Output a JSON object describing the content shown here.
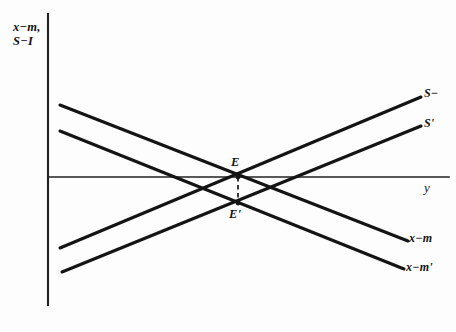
{
  "figure": {
    "name": "open-economy-balance-diagram",
    "background_color": "#fdfdfd",
    "ink_color": "#141414"
  },
  "axes": {
    "vertical": {
      "label_line1": "x−m,",
      "label_line2": "S−I",
      "x": 48,
      "y_top": 14,
      "y_bottom": 305
    },
    "horizontal": {
      "label": "y",
      "y": 177,
      "x_left": 48,
      "x_right": 449
    }
  },
  "curves": [
    {
      "name": "s-minus-i",
      "label": "S−",
      "direction": "upward",
      "x1": 60,
      "y1": 248,
      "x2": 421,
      "y2": 97
    },
    {
      "name": "s-minus-i-prime",
      "label": "S'",
      "direction": "upward",
      "x1": 62,
      "y1": 272,
      "x2": 421,
      "y2": 126
    },
    {
      "name": "x-minus-m",
      "label": "x−m",
      "direction": "downward",
      "x1": 60,
      "y1": 105,
      "x2": 408,
      "y2": 241
    },
    {
      "name": "x-minus-m-prime",
      "label": "x−m'",
      "direction": "downward",
      "x1": 60,
      "y1": 131,
      "x2": 404,
      "y2": 269
    }
  ],
  "points": [
    {
      "name": "equilibrium-e",
      "label": "E",
      "x": 238,
      "y": 177
    },
    {
      "name": "equilibrium-e-prime",
      "label": "E'",
      "x": 238,
      "y": 203
    }
  ],
  "connector": {
    "name": "dashed-connector",
    "x": 238,
    "y_top": 177,
    "y_bottom": 203,
    "style": "dashed"
  },
  "chart_data": {
    "type": "line",
    "title": "",
    "xlabel": "y",
    "ylabel": "x−m, S−I",
    "grid": false,
    "legend": "inline-curve-labels",
    "series": [
      {
        "name": "S−",
        "points": [
          [
            60,
            248
          ],
          [
            421,
            97
          ]
        ]
      },
      {
        "name": "S'",
        "points": [
          [
            62,
            272
          ],
          [
            421,
            126
          ]
        ]
      },
      {
        "name": "x−m",
        "points": [
          [
            60,
            105
          ],
          [
            408,
            241
          ]
        ]
      },
      {
        "name": "x−m'",
        "points": [
          [
            60,
            131
          ],
          [
            404,
            269
          ]
        ]
      }
    ],
    "annotations": [
      {
        "text": "E",
        "x": 238,
        "y": 177
      },
      {
        "text": "E'",
        "x": 238,
        "y": 203
      }
    ]
  }
}
